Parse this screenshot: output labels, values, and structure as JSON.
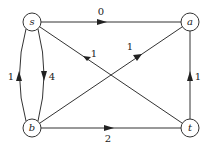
{
  "nodes": [
    {
      "id": "s",
      "label": "s",
      "x": 32,
      "y": 22
    },
    {
      "id": "a",
      "label": "a",
      "x": 190,
      "y": 22
    },
    {
      "id": "b",
      "label": "b",
      "x": 32,
      "y": 128
    },
    {
      "id": "t",
      "label": "t",
      "x": 190,
      "y": 128
    }
  ],
  "edges": [
    {
      "from": "s",
      "to": "a",
      "label": "0"
    },
    {
      "from": "t",
      "to": "s",
      "label": "1"
    },
    {
      "from": "b",
      "to": "a",
      "label": "1"
    },
    {
      "from": "s",
      "to": "b",
      "label": "4"
    },
    {
      "from": "b",
      "to": "s",
      "label": "1"
    },
    {
      "from": "b",
      "to": "t",
      "label": "2"
    },
    {
      "from": "t",
      "to": "a",
      "label": "1"
    }
  ],
  "colors": {
    "stroke": "#333333",
    "fill": "#ffffff"
  }
}
